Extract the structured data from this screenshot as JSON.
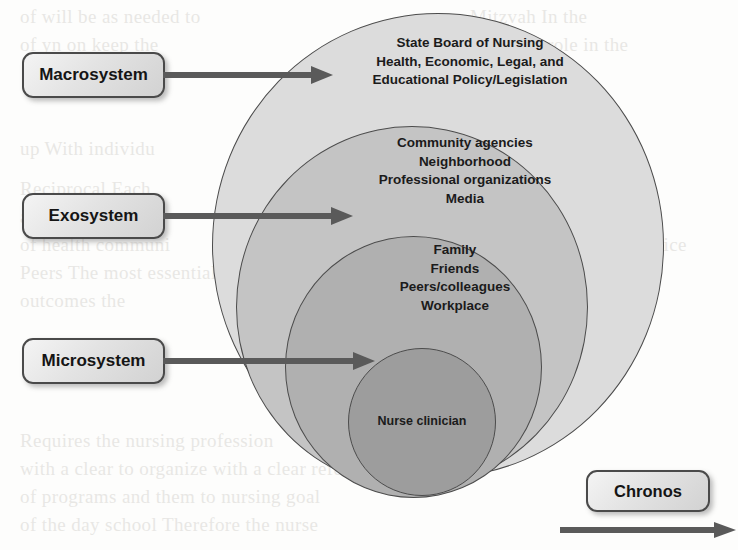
{
  "diagram": {
    "rings": [
      {
        "id": "macrosystem",
        "label": "Macrosystem",
        "fill": "#dcdcdc",
        "lines": [
          "State Board of Nursing",
          "Health, Economic, Legal, and",
          "Educational Policy/Legislation"
        ],
        "text": "State Board of Nursing\nHealth, Economic, Legal, and\nEducational Policy/Legislation"
      },
      {
        "id": "exosystem",
        "label": "Exosystem",
        "fill": "#c4c4c4",
        "lines": [
          "Community agencies",
          "Neighborhood",
          "Professional organizations",
          "Media"
        ],
        "text": "Community agencies\nNeighborhood\nProfessional organizations\nMedia"
      },
      {
        "id": "microsystem",
        "label": "Microsystem",
        "fill": "#b0b0b0",
        "lines": [
          "Family",
          "Friends",
          "Peers/colleagues",
          "Workplace"
        ],
        "text": "Family\nFriends\nPeers/colleagues\nWorkplace"
      },
      {
        "id": "core",
        "label": "Nurse clinician",
        "fill": "#9d9d9d",
        "lines": [
          "Nurse clinician"
        ],
        "text": "Nurse clinician"
      }
    ],
    "callouts": {
      "macrosystem": "Macrosystem",
      "exosystem": "Exosystem",
      "microsystem": "Microsystem",
      "chronos": "Chronos"
    },
    "colors": {
      "outline": "#4c4c4c",
      "arrow": "#5a5a5a",
      "text": "#1b1b1b",
      "box_border": "#4a4a4a"
    }
  },
  "background_text": {
    "lines": [
      "of will be as needed to",
      "Mitzvah In the",
      "of yn on keep the",
      "powerful role in the",
      "up With individu",
      "Reciprocal  Each",
      "Clinical Setting",
      "and are able to",
      "group that time",
      "of health communi",
      "strategies Add to a practice",
      "Peers  The most essential body  unionism",
      "the to that with in the",
      "outcomes the",
      "maintain on",
      "interdisciplinary",
      "evaluation",
      "Requires  the nursing profession",
      "with a clear to organize with a clear reference",
      "of programs  and them to nursing goal",
      "of the day  school  Therefore  the nurse"
    ]
  }
}
